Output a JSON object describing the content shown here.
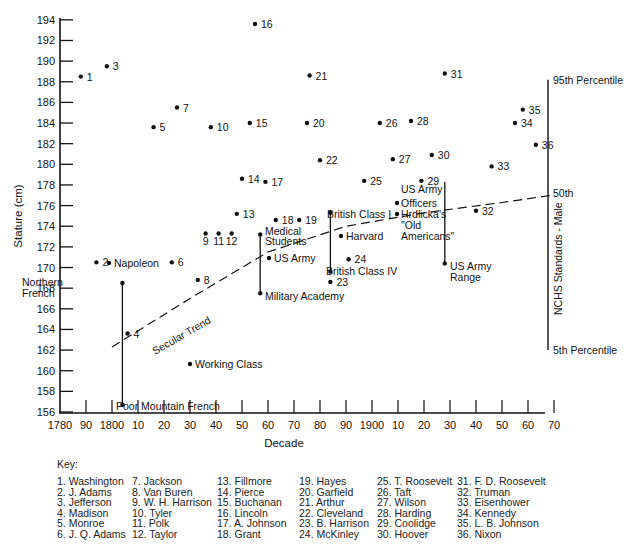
{
  "chart_data": {
    "type": "scatter",
    "title": "",
    "xlabel": "Decade",
    "ylabel": "Stature (cm)",
    "xlim": [
      1780,
      1970
    ],
    "ylim": [
      156,
      194
    ],
    "grid": false,
    "x_tick_labels": [
      "1780",
      "90",
      "1800",
      "10",
      "20",
      "30",
      "40",
      "50",
      "60",
      "70",
      "80",
      "90",
      "1900",
      "10",
      "20",
      "30",
      "40",
      "50",
      "60",
      "70"
    ],
    "x_tick_values": [
      1780,
      1790,
      1800,
      1810,
      1820,
      1830,
      1840,
      1850,
      1860,
      1870,
      1880,
      1890,
      1900,
      1910,
      1920,
      1930,
      1940,
      1950,
      1960,
      1970
    ],
    "y_tick_values": [
      156,
      158,
      160,
      162,
      164,
      166,
      168,
      170,
      172,
      174,
      176,
      178,
      180,
      182,
      184,
      186,
      188,
      190,
      192,
      194
    ],
    "presidents": [
      {
        "n": 1,
        "x": 1788,
        "y": 188.5
      },
      {
        "n": 2,
        "x": 1794,
        "y": 170.5
      },
      {
        "n": 3,
        "x": 1798,
        "y": 189.5
      },
      {
        "n": 4,
        "x": 1806,
        "y": 163.6
      },
      {
        "n": 5,
        "x": 1816,
        "y": 183.6
      },
      {
        "n": 6,
        "x": 1823,
        "y": 170.5
      },
      {
        "n": 7,
        "x": 1825,
        "y": 185.5
      },
      {
        "n": 8,
        "x": 1833,
        "y": 168.8
      },
      {
        "n": 9,
        "x": 1836,
        "y": 173.3
      },
      {
        "n": 10,
        "x": 1838,
        "y": 183.6
      },
      {
        "n": 11,
        "x": 1841,
        "y": 173.3
      },
      {
        "n": 12,
        "x": 1846,
        "y": 173.3
      },
      {
        "n": 13,
        "x": 1848,
        "y": 175.2
      },
      {
        "n": 14,
        "x": 1850,
        "y": 178.6
      },
      {
        "n": 15,
        "x": 1853,
        "y": 184
      },
      {
        "n": 16,
        "x": 1855,
        "y": 193.6
      },
      {
        "n": 17,
        "x": 1859,
        "y": 178.3
      },
      {
        "n": 18,
        "x": 1863,
        "y": 174.6
      },
      {
        "n": 19,
        "x": 1872,
        "y": 174.6
      },
      {
        "n": 20,
        "x": 1875,
        "y": 184
      },
      {
        "n": 21,
        "x": 1876,
        "y": 188.6
      },
      {
        "n": 22,
        "x": 1880,
        "y": 180.4
      },
      {
        "n": 23,
        "x": 1884,
        "y": 168.6
      },
      {
        "n": 24,
        "x": 1891,
        "y": 170.8
      },
      {
        "n": 25,
        "x": 1897,
        "y": 178.4
      },
      {
        "n": 26,
        "x": 1903,
        "y": 184
      },
      {
        "n": 27,
        "x": 1908,
        "y": 180.5
      },
      {
        "n": 28,
        "x": 1915,
        "y": 184.2
      },
      {
        "n": 29,
        "x": 1919,
        "y": 178.4
      },
      {
        "n": 30,
        "x": 1923,
        "y": 180.9
      },
      {
        "n": 31,
        "x": 1928,
        "y": 188.8
      },
      {
        "n": 32,
        "x": 1940,
        "y": 175.5
      },
      {
        "n": 33,
        "x": 1946,
        "y": 179.8
      },
      {
        "n": 34,
        "x": 1955,
        "y": 184
      },
      {
        "n": 35,
        "x": 1958,
        "y": 185.3
      },
      {
        "n": 36,
        "x": 1963,
        "y": 181.9
      }
    ],
    "reference_points": [
      {
        "label": "Napoleon",
        "x": 1810,
        "y": 168.5
      },
      {
        "label": "Working Class",
        "x": 1833,
        "y": 161
      },
      {
        "label": "US Army",
        "x": 1862,
        "y": 171.2
      },
      {
        "label": "Harvard",
        "x": 1893,
        "y": 173.5
      },
      {
        "label": "US Army Officers",
        "x": 1910,
        "y": 176.5
      },
      {
        "label": "Hrdlicka's \"Old Americans\"",
        "x": 1910,
        "y": 175.5
      }
    ],
    "range_bars": [
      {
        "x": 1804,
        "top": 168.5,
        "bottom": 156.7,
        "top_label": "Northern French",
        "bottom_label": "Poor Mountain French"
      },
      {
        "x": 1857,
        "top": 173.2,
        "bottom": 167.5,
        "top_label": "Medical Students",
        "bottom_label": "Military Academy"
      },
      {
        "x": 1884,
        "top": 175.3,
        "bottom": 169.6,
        "top_label": "British Class I",
        "bottom_label": "British Class IV"
      },
      {
        "x": 1928,
        "top": 178.3,
        "bottom": 170.4,
        "top_label": "",
        "bottom_label": "US Army Range"
      }
    ],
    "secular_trend": {
      "label": "Secular Trend",
      "points": [
        [
          1800,
          162.3
        ],
        [
          1830,
          167.0
        ],
        [
          1860,
          171.5
        ],
        [
          1890,
          174.0
        ],
        [
          1920,
          175.3
        ],
        [
          1950,
          176.3
        ],
        [
          1969,
          177.0
        ]
      ]
    },
    "nchs": {
      "label": "NCHS Standards - Male",
      "x": 1969,
      "p95": 188.2,
      "p50": 177.0,
      "p5": 162.0,
      "p95_label": "95th Percentile",
      "p50_label": "50th",
      "p5_label": "5th Percentile"
    }
  },
  "key": {
    "title": "Key:",
    "columns": [
      [
        "1. Washington",
        "2. J. Adams",
        "3. Jefferson",
        "4. Madison",
        "5. Monroe",
        "6. J. Q. Adams"
      ],
      [
        "7. Jackson",
        "8. Van Buren",
        "9. W. H. Harrison",
        "10. Tyler",
        "11. Polk",
        "12. Taylor"
      ],
      [
        "13. Fillmore",
        "14. Pierce",
        "15. Buchanan",
        "16. Lincoln",
        "17. A. Johnson",
        "18. Grant"
      ],
      [
        "19. Hayes",
        "20. Garfield",
        "21. Arthur",
        "22. Cleveland",
        "23. B. Harrison",
        "24. McKinley"
      ],
      [
        "25. T. Roosevelt",
        "26. Taft",
        "27. Wilson",
        "28. Harding",
        "29. Coolidge",
        "30. Hoover"
      ],
      [
        "31. F. D. Roosevelt",
        "32. Truman",
        "33. Eisenhower",
        "34. Kennedy",
        "35. L. B. Johnson",
        "36. Nixon"
      ]
    ]
  }
}
